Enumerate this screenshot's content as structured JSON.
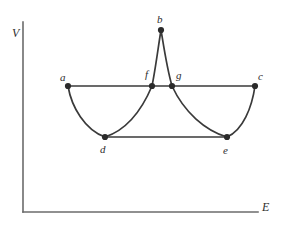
{
  "figure": {
    "kind": "line-diagram",
    "background": "#ffffff",
    "stroke_color": "#3a3a3a",
    "axis_color": "#6b6b6b",
    "label_color": "#2e2e2e",
    "axes": {
      "y_label": "V",
      "x_label": "E",
      "y_label_pos": {
        "x": 12,
        "y": 27
      },
      "x_label_pos": {
        "x": 262,
        "y": 201
      },
      "origin": {
        "x": 23,
        "y": 212
      },
      "y_top": 22,
      "x_right": 258
    },
    "points": [
      {
        "id": "a",
        "label": "a",
        "x": 68,
        "y": 86,
        "label_x": 60,
        "label_y": 72
      },
      {
        "id": "b",
        "label": "b",
        "x": 161,
        "y": 30,
        "label_x": 157,
        "label_y": 14
      },
      {
        "id": "c",
        "label": "c",
        "x": 255,
        "y": 86,
        "label_x": 258,
        "label_y": 71
      },
      {
        "id": "d",
        "label": "d",
        "x": 105,
        "y": 137,
        "label_x": 100,
        "label_y": 144
      },
      {
        "id": "e",
        "label": "e",
        "x": 227,
        "y": 137,
        "label_x": 223,
        "label_y": 145
      },
      {
        "id": "f",
        "label": "f",
        "x": 152,
        "y": 86,
        "label_x": 145,
        "label_y": 69
      },
      {
        "id": "g",
        "label": "g",
        "x": 172,
        "y": 86,
        "label_x": 176,
        "label_y": 70
      }
    ],
    "tie_lines": [
      {
        "id": "upper-tie-line",
        "from": "a",
        "to": "c"
      },
      {
        "id": "lower-tie-line",
        "from": "d",
        "to": "e"
      }
    ],
    "curve_segments": [
      {
        "id": "segment-a-d",
        "from": "a",
        "to": "d"
      },
      {
        "id": "segment-d-f",
        "from": "d",
        "to": "f"
      },
      {
        "id": "segment-f-b",
        "from": "f",
        "to": "b"
      },
      {
        "id": "segment-b-g",
        "from": "b",
        "to": "g"
      },
      {
        "id": "segment-g-e",
        "from": "g",
        "to": "e"
      },
      {
        "id": "segment-e-c",
        "from": "e",
        "to": "c"
      }
    ],
    "paths": {
      "free_energy_curve": "M 68 86 C 72 108 86 131 105 137 C 124 131 140 111 152 86 C 155 70 158 46 161 30 C 164 46 168 70 172 86 C 184 111 200 131 227 137 C 242 131 251 108 255 86"
    }
  }
}
